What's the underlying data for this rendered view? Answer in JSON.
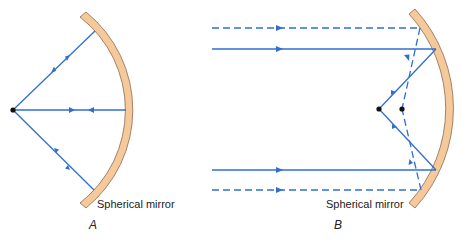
{
  "figure": {
    "colors": {
      "ray": "#2f6fd0",
      "mirror_fill": "#f5c99a",
      "mirror_stroke": "#8a6a50",
      "focus_dot": "#111111",
      "text": "#222222",
      "background": "#ffffff"
    },
    "panels": [
      {
        "id": "A",
        "panel_label": "A",
        "mirror_label": "Spherical mirror",
        "description": "Rays from a point source at the center of curvature reflect back along themselves",
        "source_point": [
          13,
          110
        ],
        "rays": [
          {
            "type": "solid",
            "from": [
              13,
              110
            ],
            "to": [
              95,
              31
            ],
            "arrows": "both"
          },
          {
            "type": "solid",
            "from": [
              13,
              110
            ],
            "to": [
              126,
              110
            ],
            "arrows": "both"
          },
          {
            "type": "solid",
            "from": [
              13,
              110
            ],
            "to": [
              94,
              190
            ],
            "arrows": "both"
          }
        ]
      },
      {
        "id": "B",
        "panel_label": "B",
        "mirror_label": "Spherical mirror",
        "description": "Parallel rays near the axis converge at the focal point; rays far from the axis converge closer to the mirror (spherical aberration)",
        "focus_points": [
          [
            379,
            109
          ],
          [
            402,
            109
          ]
        ],
        "rays": [
          {
            "type": "dashed",
            "from": [
              212,
              28
            ],
            "to": [
              420,
              28
            ]
          },
          {
            "type": "solid",
            "from": [
              212,
              49
            ],
            "to": [
              436,
              49
            ]
          },
          {
            "type": "solid",
            "from": [
              212,
              170
            ],
            "to": [
              436,
              170
            ]
          },
          {
            "type": "dashed",
            "from": [
              212,
              190
            ],
            "to": [
              421,
              190
            ]
          }
        ]
      }
    ]
  }
}
